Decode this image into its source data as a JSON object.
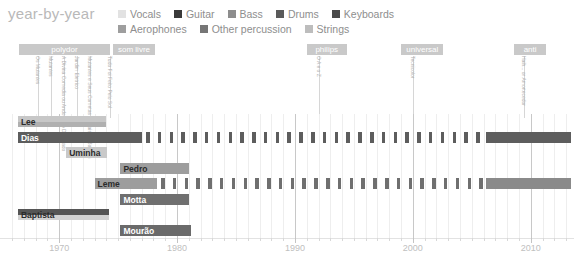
{
  "header": {
    "title": "year-by-year"
  },
  "legend": {
    "rows": [
      [
        {
          "label": "Vocals",
          "color": "#e2e2e2"
        },
        {
          "label": "Guitar",
          "color": "#3a3a3a"
        },
        {
          "label": "Bass",
          "color": "#8d8d8d"
        },
        {
          "label": "Drums",
          "color": "#5a5a5a"
        },
        {
          "label": "Keyboards",
          "color": "#4a4a4a"
        }
      ],
      [
        {
          "label": "Aerophones",
          "color": "#9e9e9e"
        },
        {
          "label": "Other percussion",
          "color": "#767676"
        },
        {
          "label": "Strings",
          "color": "#bdbdbd"
        }
      ]
    ]
  },
  "eras": [
    {
      "name": "polydor",
      "start": 1966.6,
      "end": 1974.3
    },
    {
      "name": "som livre",
      "start": 1974.6,
      "end": 1978.1
    },
    {
      "name": "philips",
      "start": 1991.0,
      "end": 1994.4
    },
    {
      "name": "universal",
      "start": 1999.0,
      "end": 2002.6
    },
    {
      "name": "anti",
      "start": 2008.6,
      "end": 2011.3
    }
  ],
  "annotations": [
    {
      "text": "Os Mutantes",
      "year": 1968.2
    },
    {
      "text": "Mutantes",
      "year": 1969.3
    },
    {
      "text": "A Divina Comedia ou Ando Meio Desligado",
      "year": 1970.4
    },
    {
      "text": "Jardim Eletrico",
      "year": 1971.5
    },
    {
      "text": "Mutantes e Seus Cometas no Pais do Baurets",
      "year": 1972.6
    },
    {
      "text": "Tudo Foi Feito Pelo Sol",
      "year": 1974.3
    },
    {
      "text": "O A e o Z",
      "year": 1992.0
    },
    {
      "text": "Tecnicolor",
      "year": 2000.0
    },
    {
      "text": "Haih... or Amortecedor",
      "year": 2009.4
    }
  ],
  "chart_data": {
    "type": "timeline",
    "title": "year-by-year",
    "xlabel": "",
    "ylabel": "",
    "xlim": [
      1966,
      2013.5
    ],
    "xticks": [
      1970,
      1980,
      1990,
      2000,
      2010
    ],
    "tick_step": 1,
    "grid": true,
    "legend_position": "top",
    "members": [
      {
        "name": "Lee",
        "label_color": "dark",
        "segments": [
          {
            "instrument": "Vocals",
            "color": "#c7c7c7",
            "start": 1966.5,
            "end": 1974.0,
            "style": "solid",
            "band": "top"
          },
          {
            "instrument": "Strings",
            "color": "#b0b0b0",
            "start": 1966.5,
            "end": 1974.0,
            "style": "solid",
            "band": "bottom"
          }
        ]
      },
      {
        "name": "Dias",
        "label_color": "light",
        "segments": [
          {
            "instrument": "Guitar",
            "color": "#5d5d5d",
            "start": 1966.5,
            "end": 1977.0,
            "style": "solid",
            "band": "full"
          },
          {
            "instrument": "Guitar",
            "color": "#5d5d5d",
            "start": 1977.4,
            "end": 2006.0,
            "style": "dashed",
            "band": "full"
          },
          {
            "instrument": "Guitar",
            "color": "#5d5d5d",
            "start": 2006.2,
            "end": 2013.4,
            "style": "solid",
            "band": "full"
          }
        ]
      },
      {
        "name": "Uminha",
        "label_color": "dark",
        "segments": [
          {
            "instrument": "Drums",
            "color": "#c9c9c9",
            "start": 1970.6,
            "end": 1974.1,
            "style": "solid",
            "band": "full"
          }
        ]
      },
      {
        "name": "Pedro",
        "label_color": "dark",
        "segments": [
          {
            "instrument": "Drums",
            "color": "#9d9d9d",
            "start": 1975.2,
            "end": 1981.0,
            "style": "solid",
            "band": "full"
          }
        ]
      },
      {
        "name": "Leme",
        "label_color": "dark",
        "segments": [
          {
            "instrument": "Bass",
            "color": "#9d9d9d",
            "start": 1973.0,
            "end": 1978.3,
            "style": "solid",
            "band": "full"
          },
          {
            "instrument": "Bass",
            "color": "#6f6f6f",
            "start": 1978.6,
            "end": 2006.0,
            "style": "dashed",
            "band": "full"
          },
          {
            "instrument": "Bass",
            "color": "#8a8a8a",
            "start": 2006.2,
            "end": 2013.4,
            "style": "solid",
            "band": "full"
          }
        ]
      },
      {
        "name": "Motta",
        "label_color": "light",
        "segments": [
          {
            "instrument": "Keyboards",
            "color": "#6f6f6f",
            "start": 1975.2,
            "end": 1981.0,
            "style": "solid",
            "band": "full"
          }
        ]
      },
      {
        "name": "Baptista",
        "label_color": "dark",
        "segments": [
          {
            "instrument": "Guitar",
            "color": "#555555",
            "start": 1966.5,
            "end": 1974.2,
            "style": "solid",
            "band": "top"
          },
          {
            "instrument": "Vocals",
            "color": "#d2d2d2",
            "start": 1966.5,
            "end": 1974.2,
            "style": "solid",
            "band": "bottom"
          }
        ]
      },
      {
        "name": "Mourão",
        "label_color": "light",
        "segments": [
          {
            "instrument": "Other percussion",
            "color": "#6a6a6a",
            "start": 1975.2,
            "end": 1981.2,
            "style": "solid",
            "band": "full"
          }
        ]
      }
    ]
  }
}
